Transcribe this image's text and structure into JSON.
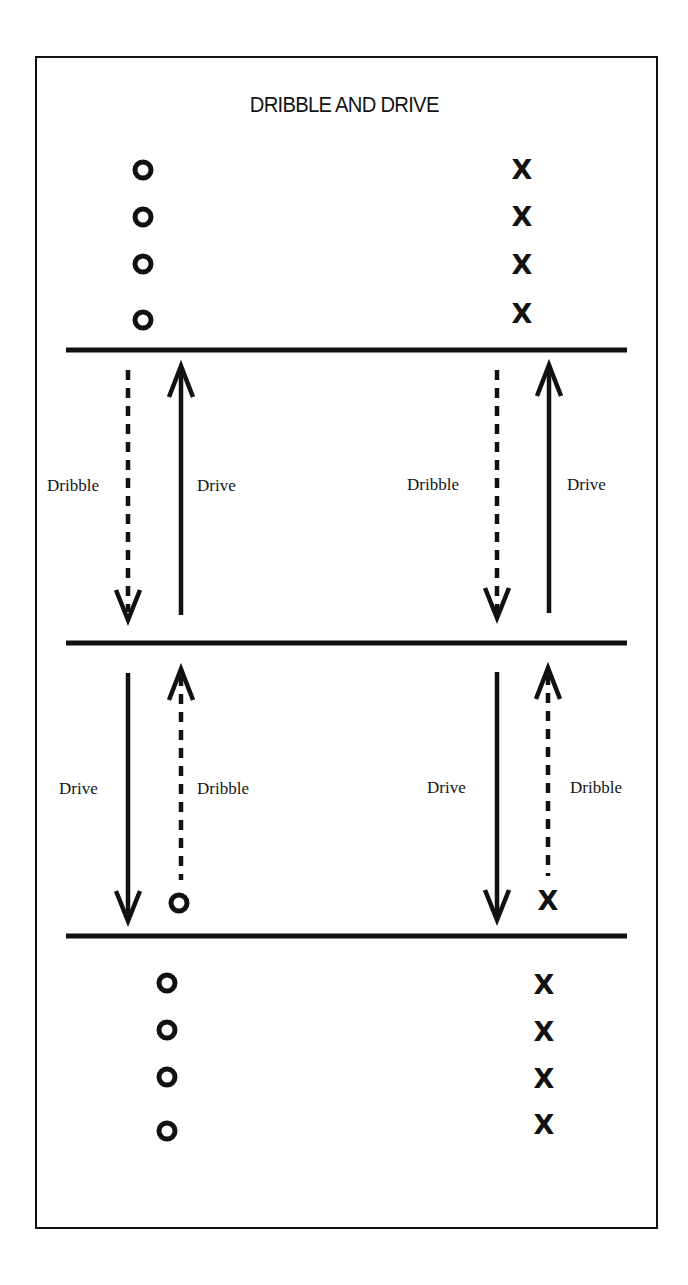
{
  "title": "DRIBBLE AND DRIVE",
  "colors": {
    "ink": "#111111",
    "background": "#ffffff"
  },
  "labels": {
    "upper_left_dribble": "Dribble",
    "upper_left_drive": "Drive",
    "upper_right_dribble": "Dribble",
    "upper_right_drive": "Drive",
    "lower_left_drive": "Drive",
    "lower_left_dribble": "Dribble",
    "lower_right_drive": "Drive",
    "lower_right_dribble": "Dribble"
  },
  "players": {
    "top_o_symbol": "O",
    "top_x_symbol": "X",
    "x_mark": "X",
    "top_o_count": 4,
    "top_x_count": 4,
    "bottom_o_count": 4,
    "bottom_x_count": 4
  },
  "legend": {
    "solid_line": "Drive",
    "dashed_line": "Dribble",
    "circle": "O player",
    "cross": "X player"
  }
}
